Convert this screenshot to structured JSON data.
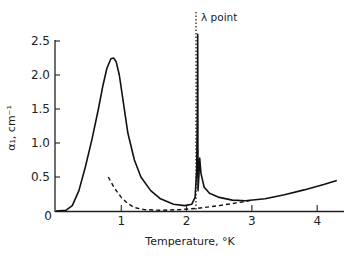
{
  "chart_data": {
    "type": "line",
    "title": "",
    "xlabel": "Temperature, °K",
    "ylabel": "α₁, cm⁻¹",
    "xlim": [
      0,
      4.4
    ],
    "ylim": [
      0,
      2.6
    ],
    "grid": false,
    "legend": null,
    "x_ticks": [
      0,
      1,
      2,
      3,
      4
    ],
    "x_tick_labels": [
      "0",
      "1",
      "2",
      "3",
      "4"
    ],
    "y_ticks": [
      0.5,
      1.0,
      1.5,
      2.0,
      2.5
    ],
    "y_tick_labels": [
      "0.5",
      "1.0",
      "1.5",
      "2.0",
      "2.5"
    ],
    "origin_label": "0",
    "annotations": [
      {
        "text": "λ point",
        "x": 2.17,
        "style": "dotted vertical line"
      }
    ],
    "series": [
      {
        "name": "solid",
        "style": "solid",
        "points": [
          [
            0.0,
            0.0
          ],
          [
            0.15,
            0.01
          ],
          [
            0.25,
            0.08
          ],
          [
            0.35,
            0.3
          ],
          [
            0.45,
            0.65
          ],
          [
            0.55,
            1.05
          ],
          [
            0.65,
            1.5
          ],
          [
            0.72,
            1.85
          ],
          [
            0.78,
            2.1
          ],
          [
            0.84,
            2.24
          ],
          [
            0.88,
            2.25
          ],
          [
            0.92,
            2.2
          ],
          [
            0.97,
            2.0
          ],
          [
            1.03,
            1.6
          ],
          [
            1.1,
            1.15
          ],
          [
            1.2,
            0.75
          ],
          [
            1.3,
            0.5
          ],
          [
            1.45,
            0.3
          ],
          [
            1.6,
            0.18
          ],
          [
            1.8,
            0.1
          ],
          [
            1.97,
            0.08
          ],
          [
            2.08,
            0.1
          ],
          [
            2.13,
            0.2
          ],
          [
            2.155,
            0.6
          ],
          [
            2.165,
            1.5
          ],
          [
            2.17,
            2.6
          ],
          [
            2.175,
            0.3
          ],
          [
            2.19,
            0.55
          ],
          [
            2.2,
            0.78
          ],
          [
            2.22,
            0.55
          ],
          [
            2.27,
            0.35
          ],
          [
            2.35,
            0.26
          ],
          [
            2.5,
            0.2
          ],
          [
            2.7,
            0.16
          ],
          [
            2.9,
            0.15
          ],
          [
            3.2,
            0.18
          ],
          [
            3.5,
            0.24
          ],
          [
            3.8,
            0.31
          ],
          [
            4.1,
            0.39
          ],
          [
            4.3,
            0.45
          ]
        ]
      },
      {
        "name": "dashed",
        "style": "dashed",
        "points": [
          [
            0.8,
            0.5
          ],
          [
            0.9,
            0.33
          ],
          [
            1.0,
            0.2
          ],
          [
            1.1,
            0.11
          ],
          [
            1.2,
            0.05
          ],
          [
            1.35,
            0.02
          ],
          [
            1.6,
            0.01
          ],
          [
            1.9,
            0.02
          ],
          [
            2.17,
            0.04
          ],
          [
            2.5,
            0.08
          ],
          [
            2.9,
            0.14
          ],
          [
            3.0,
            0.16
          ]
        ]
      }
    ]
  }
}
